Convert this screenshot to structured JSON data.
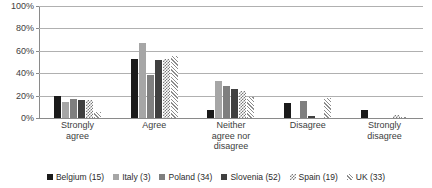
{
  "chart_data": {
    "type": "bar",
    "title": "",
    "xlabel": "",
    "ylabel": "",
    "ylim": [
      0,
      100
    ],
    "yticks": [
      0,
      20,
      40,
      60,
      80,
      100
    ],
    "ytick_labels": [
      "0%",
      "20%",
      "40%",
      "60%",
      "80%",
      "100%"
    ],
    "grid": true,
    "legend_position": "bottom",
    "categories": [
      "Strongly agree",
      "Agree",
      "Neither agree nor disagree",
      "Disagree",
      "Strongly disagree"
    ],
    "category_lines": [
      [
        "Strongly",
        "agree"
      ],
      [
        "Agree"
      ],
      [
        "Neither",
        "agree nor",
        "disagree"
      ],
      [
        "Disagree"
      ],
      [
        "Strongly",
        "disagree"
      ]
    ],
    "series": [
      {
        "name": "Belgium (15)",
        "color": "#1a1a1a",
        "pattern": "solid",
        "values": [
          20,
          53,
          7,
          13,
          7
        ]
      },
      {
        "name": "Italy (3)",
        "color": "#a6a6a6",
        "pattern": "solid",
        "values": [
          14,
          67,
          33,
          0,
          0
        ]
      },
      {
        "name": "Poland (34)",
        "color": "#7f7f7f",
        "pattern": "solid",
        "values": [
          17,
          38,
          29,
          15,
          0
        ]
      },
      {
        "name": "Slovenia (52)",
        "color": "#404040",
        "pattern": "solid",
        "values": [
          16,
          52,
          26,
          2,
          0
        ]
      },
      {
        "name": "Spain (19)",
        "color": "#7a7a7a",
        "pattern": "checker",
        "values": [
          16,
          53,
          24,
          0,
          3
        ]
      },
      {
        "name": "UK (33)",
        "color": "#8c8c8c",
        "pattern": "diagonal",
        "values": [
          5,
          55,
          19,
          18,
          1
        ]
      }
    ]
  },
  "legend": {
    "items": [
      {
        "label": "Belgium (15)"
      },
      {
        "label": "Italy (3)"
      },
      {
        "label": "Poland (34)"
      },
      {
        "label": "Slovenia (52)"
      },
      {
        "label": "Spain (19)"
      },
      {
        "label": "UK (33)"
      }
    ]
  }
}
